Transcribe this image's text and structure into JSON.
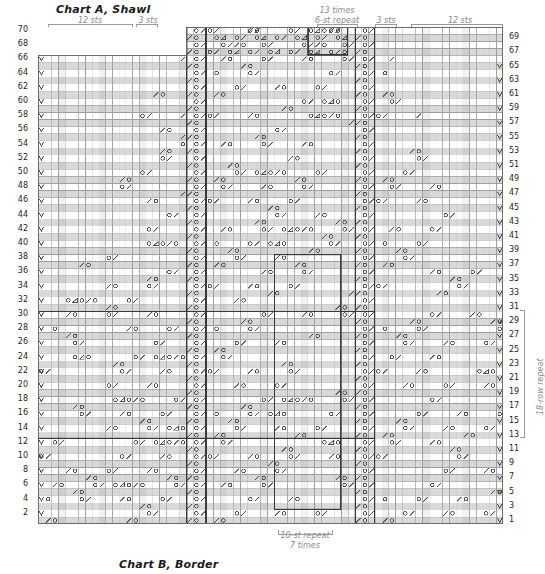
{
  "titles": {
    "chart_a": "Chart A, Shawl",
    "chart_b": "Chart B, Border"
  },
  "top_annotations": {
    "left_12_sts": "12 sts",
    "left_3_sts": "3 sts",
    "times_13": "13 times",
    "repeat_6st": "6-st repeat",
    "right_3_sts": "3 sts",
    "right_12_sts": "12 sts"
  },
  "bottom_annotations": {
    "repeat_10st": "10-st repeat",
    "times_7": "7 times"
  },
  "side_annotations": {
    "row_repeat": "18-row repeat"
  },
  "row_numbers": {
    "left": [
      70,
      68,
      66,
      64,
      62,
      60,
      58,
      56,
      54,
      52,
      50,
      48,
      46,
      44,
      42,
      40,
      38,
      36,
      34,
      32,
      30,
      28,
      26,
      24,
      22,
      20,
      18,
      16,
      14,
      12,
      10,
      8,
      6,
      4,
      2
    ],
    "right": [
      69,
      67,
      65,
      63,
      61,
      59,
      57,
      55,
      53,
      51,
      49,
      47,
      45,
      43,
      41,
      39,
      37,
      35,
      33,
      31,
      29,
      27,
      25,
      23,
      21,
      19,
      17,
      15,
      13,
      11,
      9,
      7,
      5,
      3,
      1
    ]
  },
  "grid": {
    "columns": 69,
    "rows": 70,
    "cell_w": 6.74,
    "cell_h": 7.1,
    "shade_color": "#d9d9d9",
    "line_color": "#9e9e9e",
    "bold_line_color": "#3a3a3a",
    "symbol_color": "#4a4a4a"
  },
  "symbols_legend": [
    {
      "name": "yarn-over",
      "glyph": "o"
    },
    {
      "name": "k2tog-right-slant",
      "glyph": "/"
    },
    {
      "name": "ssk-left-slant",
      "glyph": "\\"
    },
    {
      "name": "centered-decrease",
      "glyph": "triangle"
    },
    {
      "name": "slip-stitch",
      "glyph": "V"
    }
  ],
  "bold_boxes": [
    {
      "name": "six-st-repeat-box",
      "col": 40,
      "row_top": 70,
      "cols": 6,
      "rows": 4
    },
    {
      "name": "three-st-left-panel",
      "col": 22,
      "row_top": 70,
      "cols": 3,
      "rows": 70
    },
    {
      "name": "three-st-right-panel",
      "col": 47,
      "row_top": 70,
      "cols": 3,
      "rows": 70
    },
    {
      "name": "ten-st-repeat-box",
      "col": 35,
      "row_top": 38,
      "cols": 10,
      "rows": 36
    },
    {
      "name": "eighteen-row-repeat-box",
      "col": 1,
      "row_top": 30,
      "cols": 50,
      "rows": 18
    }
  ]
}
